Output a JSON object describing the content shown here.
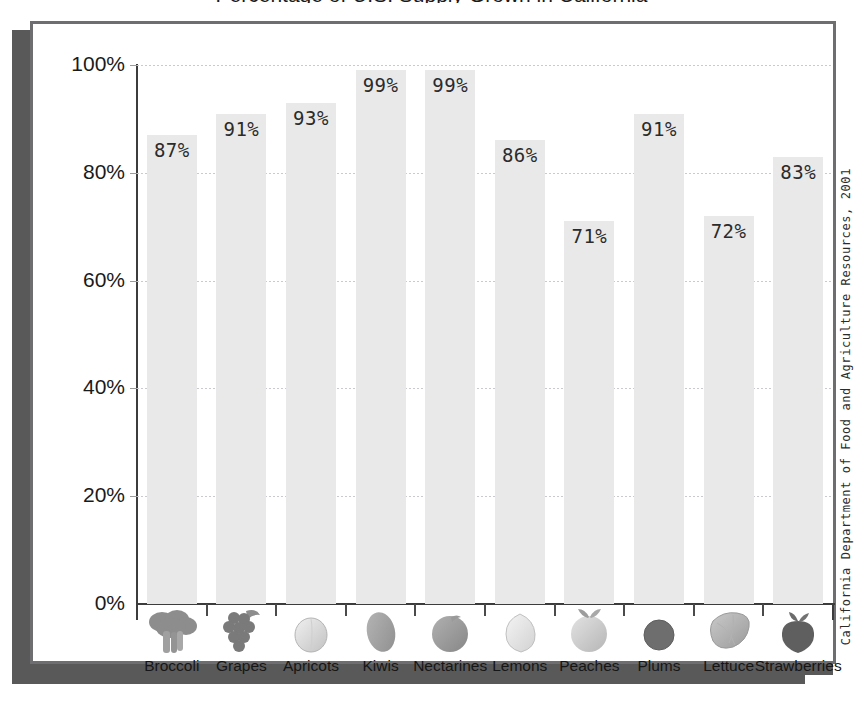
{
  "title": "Percentage of U.S. Supply Grown in California",
  "source_note": "California Department of Food and Agriculture Resources, 2001",
  "axis": {
    "y_ticks": [
      "0%",
      "20%",
      "40%",
      "60%",
      "80%",
      "100%"
    ],
    "y_min": 0,
    "y_max": 100
  },
  "chart_data": {
    "type": "bar",
    "title": "Percentage of U.S. Supply Grown in California",
    "xlabel": "",
    "ylabel": "",
    "ylim": [
      0,
      100
    ],
    "ytick_labels": [
      "0%",
      "20%",
      "40%",
      "60%",
      "80%",
      "100%"
    ],
    "ytick_values": [
      0,
      20,
      40,
      60,
      80,
      100
    ],
    "grid": true,
    "legend": "none",
    "annotations": [
      "California Department of Food and Agriculture Resources, 2001"
    ],
    "categories": [
      "Broccoli",
      "Grapes",
      "Apricots",
      "Kiwis",
      "Nectarines",
      "Lemons",
      "Peaches",
      "Plums",
      "Lettuce",
      "Strawberries"
    ],
    "values": [
      87,
      91,
      93,
      99,
      99,
      86,
      71,
      91,
      72,
      83
    ],
    "value_labels": [
      "87%",
      "91%",
      "93%",
      "99%",
      "99%",
      "86%",
      "71%",
      "91%",
      "72%",
      "83%"
    ],
    "icons": [
      "broccoli-icon",
      "grapes-icon",
      "apricot-icon",
      "kiwi-icon",
      "nectarine-icon",
      "lemon-icon",
      "peach-icon",
      "plum-icon",
      "lettuce-icon",
      "strawberry-icon"
    ]
  },
  "colors": {
    "bar_fill": "#e9e9e9",
    "axis": "#3c3c3c",
    "grid": "#c9c9cf",
    "frame": "#6e6e70",
    "shadow": "#595959",
    "text": "#1a1a1a"
  }
}
